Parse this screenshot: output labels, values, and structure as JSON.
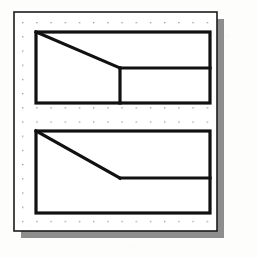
{
  "figure": {
    "background_color": "#fdfdfc",
    "panel": {
      "name": "dot-grid-panel",
      "x": 14,
      "y": 12,
      "width": 203,
      "height": 219,
      "fill_color": "#ffffff",
      "border_color": "#1c1c1c",
      "border_width": 1.6
    },
    "drop_shadow": {
      "name": "panel-drop-shadow",
      "x": 21,
      "y": 19,
      "width": 203,
      "height": 219,
      "color": "#8d8d8d",
      "offset_x": 7,
      "offset_y": 7
    },
    "dot_grid": {
      "name": "dot-grid",
      "origin_x": 22,
      "origin_y": 22,
      "spacing_x": 14.2,
      "spacing_y": 14.2,
      "columns": 14,
      "rows": 15,
      "dot_radius": 0.75,
      "dot_color": "#8a8a8a"
    },
    "shapes": [
      {
        "name": "upper-shape",
        "label": "Upper polygon: rectangle with stepped notch cut by a diagonal",
        "stroke_color": "#111111",
        "stroke_width": 3.2,
        "fill_color": "#ffffff",
        "bounds": {
          "left": 36,
          "top": 32,
          "right": 210,
          "bottom": 103
        },
        "outline_points": "36,32 210,32 210,103 36,103",
        "interior_lines": [
          {
            "name": "upper-diagonal-line",
            "x1": 36,
            "y1": 32,
            "x2": 120,
            "y2": 68
          },
          {
            "name": "upper-vertical-divider",
            "x1": 120,
            "y1": 68,
            "x2": 120,
            "y2": 103
          },
          {
            "name": "upper-horizontal-divider",
            "x1": 120,
            "y1": 68,
            "x2": 210,
            "y2": 68
          }
        ]
      },
      {
        "name": "lower-shape",
        "label": "Lower polygon: rectangle with a diagonal meeting a horizontal divider",
        "stroke_color": "#111111",
        "stroke_width": 3.2,
        "fill_color": "#ffffff",
        "bounds": {
          "left": 36,
          "top": 131,
          "right": 210,
          "bottom": 213
        },
        "outline_points": "36,131 210,131 210,213 36,213",
        "interior_lines": [
          {
            "name": "lower-diagonal-line",
            "x1": 36,
            "y1": 131,
            "x2": 120,
            "y2": 178
          },
          {
            "name": "lower-horizontal-divider",
            "x1": 120,
            "y1": 178,
            "x2": 210,
            "y2": 178
          }
        ]
      }
    ]
  }
}
